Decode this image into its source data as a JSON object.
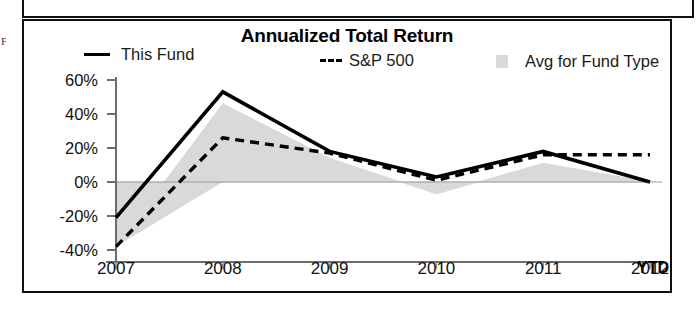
{
  "artifact": {
    "edge_mark": "F"
  },
  "chart_panel": {
    "title": "Annualized Total Return"
  },
  "legend": {
    "items": [
      {
        "label": "This Fund",
        "marker": "solid-line-icon",
        "color": "#000000"
      },
      {
        "label": "S&P 500",
        "marker": "dashed-line-icon",
        "color": "#000000"
      },
      {
        "label": "Avg for Fund Type",
        "marker": "grey-square-icon",
        "color": "#d9d9d9"
      }
    ]
  },
  "axes": {
    "y_ticks": [
      "60%",
      "40%",
      "20%",
      "0%",
      "-20%",
      "-40%"
    ],
    "x_ticks": [
      "2007",
      "2008",
      "2009",
      "2010",
      "2011",
      "2012"
    ],
    "x_suffix": "YTD"
  },
  "chart_data": {
    "type": "line",
    "title": "Annualized Total Return",
    "xlabel": "",
    "ylabel": "",
    "x": [
      "2007",
      "2008",
      "2009",
      "2010",
      "2011",
      "2012"
    ],
    "categories": [
      "2007",
      "2008",
      "2009",
      "2010",
      "2011",
      "2012"
    ],
    "ylim": [
      -40,
      60
    ],
    "yticks": [
      -40,
      -20,
      0,
      20,
      40,
      60
    ],
    "ytick_labels": [
      "-40%",
      "-20%",
      "0%",
      "20%",
      "40%",
      "60%"
    ],
    "grid": false,
    "zero_line": true,
    "legend_position": "top",
    "series": [
      {
        "name": "This Fund",
        "style": "solid",
        "color": "#000000",
        "values": [
          -21,
          53,
          18,
          3,
          18,
          0
        ]
      },
      {
        "name": "S&P 500",
        "style": "dashed",
        "color": "#000000",
        "values": [
          -38,
          26,
          17,
          1,
          16,
          16
        ]
      },
      {
        "name": "Avg for Fund Type",
        "style": "filled-area",
        "color": "#d9d9d9",
        "values": [
          -38,
          46,
          14,
          -7,
          11,
          0
        ]
      }
    ],
    "annotations": [
      "YTD"
    ]
  }
}
